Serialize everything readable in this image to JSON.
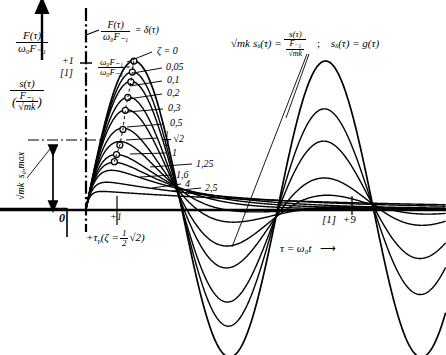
{
  "figure": {
    "axis_vertical_label_top_num": "F(τ)",
    "axis_vertical_label_top_den": "ω₀F₋₁",
    "axis_vertical_label_bottom_num": "s(τ)",
    "axis_vertical_label_bottom_den_num": "F₋₁",
    "axis_vertical_label_bottom_den_den": "√mk",
    "delta_def_num": "F(τ)",
    "delta_def_den": "ω₀F₋₁",
    "delta_def_rhs": "= δ(τ)",
    "unit_fraction_num": "ω₀F₋₁",
    "unit_fraction_den": "ω₀F₋₁",
    "unit_fraction_rhs": "=1",
    "plus_one_tick_label": "+1",
    "bracket_one_label": "[1]",
    "smax_label_rad": "√mk",
    "smax_label_sym": "s₀,max",
    "origin_label": "0",
    "tick_plus_one_x": "+1",
    "tau_p_label": "+τ",
    "tau_p_sub": "p",
    "tau_p_paren_open": "(ζ =",
    "tau_p_frac_num": "1",
    "tau_p_frac_den": "2",
    "tau_p_rad": "√2",
    "tau_p_paren_close": ")",
    "right_title_lhs_rad": "√mk",
    "right_title_lhs_sym": "s",
    "right_title_lhs_sub": "δ",
    "right_title_lhs_arg": "(τ) =",
    "right_title_frac_num": "s(τ)",
    "right_title_frac_den_num": "F₋₁",
    "right_title_frac_den_den": "√mk",
    "right_title_sep": ";",
    "right_title_rhs": "sδ(τ) = g(τ)",
    "right_title_rhs_sym": "s",
    "right_title_rhs_sub": "δ",
    "right_title_rhs_tail": "(τ) = g(τ)",
    "x_tick_bracket": "[1]",
    "x_tick_nine": "+9",
    "x_axis_label": "τ = ω₀t",
    "x_axis_arrow": "⟶",
    "zeta_first_label": "ζ = 0"
  },
  "chart_data": {
    "type": "line",
    "xlabel": "τ = ω₀t",
    "ylabel": "√mk sδ(τ)",
    "xlim": [
      -1.2,
      10.5
    ],
    "ylim": [
      -1.15,
      1.15
    ],
    "grid": false,
    "legend_position": "inline-right-of-first-peak",
    "x_ticks": [
      0,
      1,
      9
    ],
    "x_tick_labels": [
      "0",
      "+1",
      "+9"
    ],
    "y_ticks": [
      1
    ],
    "y_tick_labels": [
      "+1"
    ],
    "annotations": [
      {
        "text": "F(τ)/(ω₀F₋₁) = δ(τ)",
        "role": "impulse-definition"
      },
      {
        "text": "ω₀F₋₁/(ω₀F₋₁) = 1",
        "role": "unit-impulse-height"
      },
      {
        "text": "√mk s₀,max",
        "role": "max-amplitude-arrow"
      },
      {
        "text": "+τp(ζ = ½√2)",
        "role": "peak-time-marker"
      },
      {
        "text": "ζ = 0",
        "role": "curve-label"
      }
    ],
    "series": [
      {
        "name": "ζ = 0",
        "zeta": 0.0,
        "label": "ζ = 0",
        "peak_tau": 1.5708,
        "peak_value": 1.0
      },
      {
        "name": "0,05",
        "zeta": 0.05,
        "label": "0,05",
        "peak_tau": 1.52,
        "peak_value": 0.925
      },
      {
        "name": "0,1",
        "zeta": 0.1,
        "label": "0,1",
        "peak_tau": 1.47,
        "peak_value": 0.859
      },
      {
        "name": "0,2",
        "zeta": 0.2,
        "label": "0,2",
        "peak_tau": 1.37,
        "peak_value": 0.754
      },
      {
        "name": "0,3",
        "zeta": 0.3,
        "label": "0,3",
        "peak_tau": 1.29,
        "peak_value": 0.667
      },
      {
        "name": "0,5",
        "zeta": 0.5,
        "label": "0,5",
        "peak_tau": 1.21,
        "peak_value": 0.538
      },
      {
        "name": "½√2",
        "zeta": 0.7071,
        "label": "½ √2",
        "peak_tau": 1.11,
        "peak_value": 0.432
      },
      {
        "name": "1",
        "zeta": 1.0,
        "label": "1",
        "peak_tau": 1.0,
        "peak_value": 0.368
      },
      {
        "name": "1,25",
        "zeta": 1.25,
        "label": "1,25",
        "peak_tau": 0.93,
        "peak_value": 0.32
      },
      {
        "name": "1,6",
        "zeta": 1.6,
        "label": "1,6",
        "peak_tau": 0.8,
        "peak_value": 0.268
      },
      {
        "name": "2,5",
        "zeta": 2.5,
        "label": "2,5",
        "peak_tau": 0.55,
        "peak_value": 0.185
      },
      {
        "name": "4",
        "zeta": 4.0,
        "label": "4",
        "peak_tau": 0.36,
        "peak_value": 0.122
      }
    ]
  }
}
